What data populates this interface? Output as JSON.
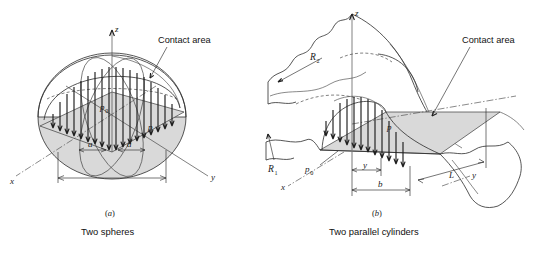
{
  "figure": {
    "title_note": "Hertzian contact pressure distribution diagrams",
    "background_color": "#ffffff",
    "contact_area_fill": "#d9d9d9",
    "line_color": "#2b2b2b"
  },
  "panel_a": {
    "key": "(a)",
    "key_paren_open": "(",
    "key_letter": "a",
    "key_paren_close": ")",
    "caption": "Two spheres",
    "callout_label": "Contact area",
    "axes": {
      "z": "z",
      "x": "x",
      "y": "y"
    },
    "labels": {
      "p0_base": "p",
      "p0_sub": "0",
      "p": "p",
      "a_left": "a",
      "a_right": "a"
    }
  },
  "panel_b": {
    "key": "(b)",
    "key_paren_open": "(",
    "key_letter": "b",
    "key_paren_close": ")",
    "caption": "Two parallel cylinders",
    "callout_label": "Contact area",
    "axes": {
      "z": "z",
      "x": "x",
      "y_front": "y",
      "y_dim": "y"
    },
    "labels": {
      "R1_base": "R",
      "R1_sub": "1",
      "R2_base": "R",
      "R2_sub": "2",
      "p0_base": "p",
      "p0_sub": "0",
      "p": "p",
      "b": "b",
      "L": "L"
    }
  }
}
